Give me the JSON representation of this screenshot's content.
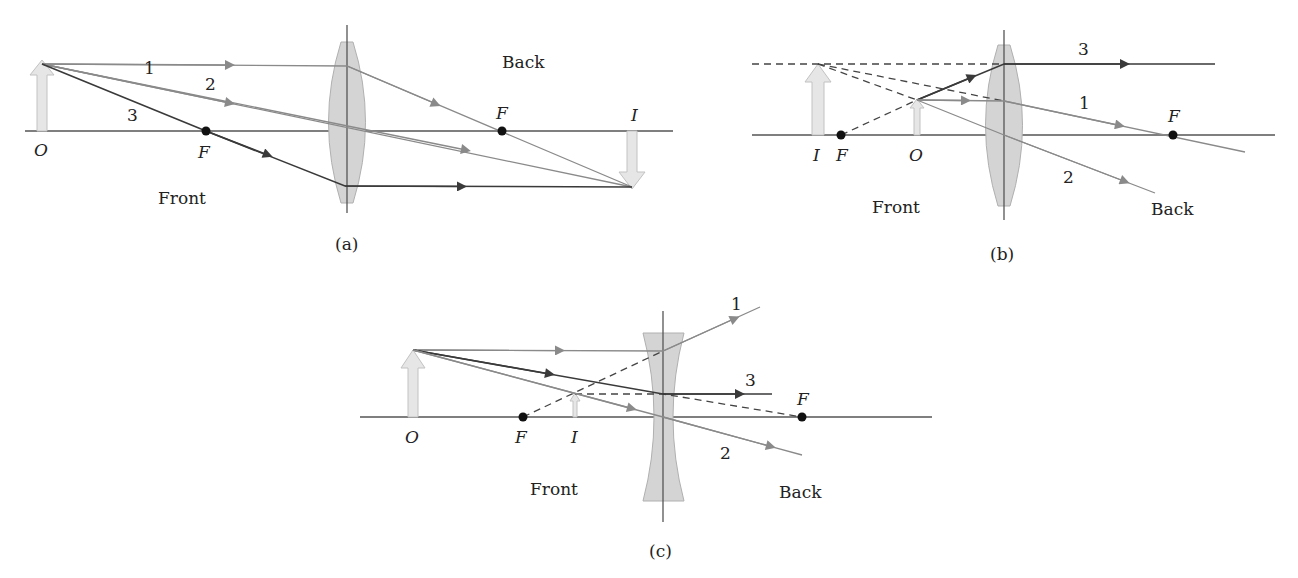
{
  "figure": {
    "panels": [
      {
        "id": "a",
        "caption": "(a)",
        "lens_type": "converging",
        "labels": {
          "object": "O",
          "image": "I",
          "focal_front": "F",
          "focal_back": "F",
          "front": "Front",
          "back": "Back"
        },
        "rays": [
          "1",
          "2",
          "3"
        ]
      },
      {
        "id": "b",
        "caption": "(b)",
        "lens_type": "converging",
        "labels": {
          "object": "O",
          "image": "I",
          "focal_front": "F",
          "focal_back": "F",
          "front": "Front",
          "back": "Back"
        },
        "rays": [
          "1",
          "2",
          "3"
        ]
      },
      {
        "id": "c",
        "caption": "(c)",
        "lens_type": "diverging",
        "labels": {
          "object": "O",
          "image": "I",
          "focal_front": "F",
          "focal_back": "F",
          "front": "Front",
          "back": "Back"
        },
        "rays": [
          "1",
          "2",
          "3"
        ]
      }
    ]
  },
  "colors": {
    "dark_ray": "#3a3a3a",
    "light_ray": "#8a8a8a",
    "lens": "#d4d4d4",
    "object_arrow": "#e6e6e6"
  }
}
